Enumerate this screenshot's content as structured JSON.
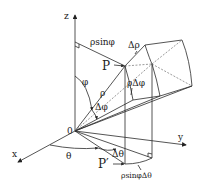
{
  "diagram": {
    "labels": {
      "z": "z",
      "x": "x",
      "y": "y",
      "origin": "0",
      "P": "P",
      "P_prime": "P′",
      "rho": "ρ",
      "phi": "φ",
      "theta": "θ",
      "delta_phi": "Δφ",
      "delta_theta": "Δθ",
      "delta_rho": "Δρ",
      "rho_sin_phi": "ρsinφ",
      "rho_delta_phi": "ρΔφ",
      "rho_sin_phi_delta_theta": "ρsinφΔθ"
    }
  }
}
